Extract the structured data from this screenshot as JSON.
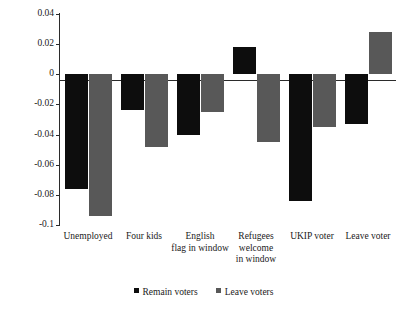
{
  "chart_data": {
    "type": "bar",
    "title": "",
    "subtitle": "",
    "xlabel": "",
    "ylabel": "",
    "ylim": [
      -0.1,
      0.04
    ],
    "grid": false,
    "legend_position": "bottom",
    "categories": [
      "Unemployed",
      "Four kids",
      "English flag in window",
      "Refugees welcome in window",
      "UKIP voter",
      "Leave voter"
    ],
    "category_lines": [
      [
        "Unemployed"
      ],
      [
        "Four kids"
      ],
      [
        "English",
        "flag in window"
      ],
      [
        "Refugees",
        "welcome",
        "in window"
      ],
      [
        "UKIP voter"
      ],
      [
        "Leave voter"
      ]
    ],
    "yticks": [
      0.04,
      0.02,
      0,
      -0.02,
      -0.04,
      -0.06,
      -0.08,
      -0.1
    ],
    "ytick_labels": [
      "0.04",
      "0.02",
      "0",
      "-0.02",
      "-0.04",
      "-0.06",
      "-0.08",
      "-0.1"
    ],
    "series": [
      {
        "name": "Remain voters",
        "color": "#0d0d0d",
        "values": [
          -0.076,
          -0.024,
          -0.04,
          0.018,
          -0.084,
          -0.033
        ]
      },
      {
        "name": "Leave voters",
        "color": "#585858",
        "values": [
          -0.094,
          -0.048,
          -0.025,
          -0.045,
          -0.035,
          0.028
        ]
      }
    ]
  },
  "legend": {
    "items": [
      {
        "label": "Remain voters",
        "color": "#0d0d0d"
      },
      {
        "label": "Leave voters",
        "color": "#585858"
      }
    ]
  }
}
